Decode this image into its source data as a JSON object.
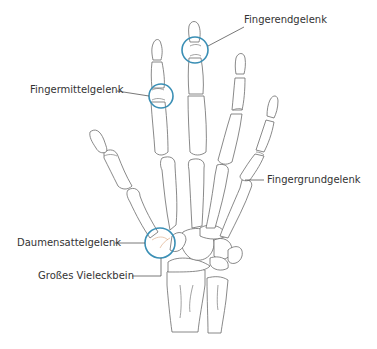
{
  "diagram": {
    "colors": {
      "bone_stroke": "#6b6b6b",
      "joint_highlight": "#3a8fb5",
      "leader_line": "#555555",
      "label_text": "#333333",
      "background": "#ffffff"
    },
    "labels": {
      "fingerendgelenk": "Fingerendgelenk",
      "fingermittelgelenk": "Fingermittelgelenk",
      "fingergrundgelenk": "Fingergrundgelenk",
      "daumensattelgelenk": "Daumensattelgelenk",
      "grosses_vieleckbein": "Großes Vieleckbein"
    },
    "highlighted_joints": [
      {
        "name": "Fingerendgelenk",
        "cx": 195,
        "cy": 50,
        "r": 13
      },
      {
        "name": "Fingermittelgelenk",
        "cx": 161,
        "cy": 96,
        "r": 12
      },
      {
        "name": "Daumensattelgelenk",
        "cx": 160,
        "cy": 243,
        "r": 15
      }
    ]
  }
}
